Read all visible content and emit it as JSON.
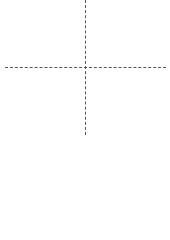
{
  "canvas": {
    "cell_size": 14.5,
    "cols": 10,
    "rows": 8,
    "grid_color": "#ececec",
    "fill_color": "#b4b4b4",
    "axis_color": "#555555"
  },
  "filled_cells": [
    {
      "col": 3,
      "row": 1
    },
    {
      "col": 6,
      "row": 1
    },
    {
      "col": 3,
      "row": 2
    },
    {
      "col": 2,
      "row": 3
    },
    {
      "col": 3,
      "row": 3
    },
    {
      "col": 4,
      "row": 3
    },
    {
      "col": 5,
      "row": 3
    },
    {
      "col": 6,
      "row": 3
    },
    {
      "col": 7,
      "row": 3
    },
    {
      "col": 4,
      "row": 4
    },
    {
      "col": 5,
      "row": 4
    },
    {
      "col": 6,
      "row": 6
    }
  ],
  "axes": {
    "vertical_x": 85,
    "horizontal_y": 67
  },
  "palette": {
    "slots": 9
  }
}
